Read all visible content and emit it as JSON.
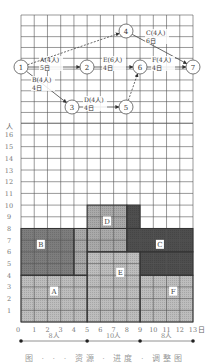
{
  "figure": {
    "caption": "图 · · · 资源 · 进度 · 调整图",
    "colors": {
      "grid": "#555555",
      "light_block": "#bdbdbd",
      "mid_block": "#a9a9a9",
      "dark_block": "#7d7d7d",
      "darker_block": "#4e4e4e",
      "node_stroke": "#555555",
      "arrow": "#444444"
    }
  },
  "network": {
    "nodes": [
      {
        "id": "1",
        "x": 21,
        "y": 67
      },
      {
        "id": "2",
        "x": 87,
        "y": 67
      },
      {
        "id": "3",
        "x": 72,
        "y": 107
      },
      {
        "id": "4",
        "x": 126,
        "y": 31
      },
      {
        "id": "5",
        "x": 126,
        "y": 107
      },
      {
        "id": "6",
        "x": 140,
        "y": 67
      },
      {
        "id": "7",
        "x": 193,
        "y": 67
      }
    ],
    "activities": [
      {
        "from": "1",
        "to": "2",
        "label": "A(4人)",
        "duration": "5日",
        "lx": 40,
        "ly": 62,
        "dashed": false
      },
      {
        "from": "1",
        "to": "3",
        "label": "B(4人)",
        "duration": "4日",
        "lx": 32,
        "ly": 82,
        "dashed": false
      },
      {
        "from": "1",
        "to": "4",
        "label": "",
        "duration": "",
        "lx": 0,
        "ly": 0,
        "dashed": true
      },
      {
        "from": "4",
        "to": "7",
        "label": "C(4人)",
        "duration": "6日",
        "lx": 146,
        "ly": 35,
        "dashed": false
      },
      {
        "from": "3",
        "to": "5",
        "label": "D(4人)",
        "duration": "4日",
        "lx": 84,
        "ly": 102,
        "dashed": false
      },
      {
        "from": "2",
        "to": "6",
        "label": "E(6人)",
        "duration": "4日",
        "lx": 103,
        "ly": 62,
        "dashed": false
      },
      {
        "from": "5",
        "to": "6",
        "label": "",
        "duration": "",
        "lx": 0,
        "ly": 0,
        "dashed": true
      },
      {
        "from": "6",
        "to": "7",
        "label": "F(4人)",
        "duration": "4日",
        "lx": 152,
        "ly": 62,
        "dashed": false
      }
    ]
  },
  "chart_data": {
    "type": "area",
    "title": "",
    "xlabel": "日",
    "ylabel": "人",
    "x_ticks": [
      "0",
      "1",
      "2",
      "3",
      "4",
      "5",
      "6",
      "7",
      "8",
      "9",
      "10",
      "11",
      "12",
      "13"
    ],
    "y_ticks": [
      "1",
      "2",
      "3",
      "4",
      "5",
      "6",
      "7",
      "8",
      "9",
      "10",
      "11",
      "12",
      "13",
      "14",
      "15",
      "16"
    ],
    "xlim": [
      0,
      13
    ],
    "ylim": [
      0,
      16
    ],
    "blocks": [
      {
        "name": "A",
        "shade": "light",
        "rects": [
          [
            0,
            0,
            5,
            4
          ]
        ],
        "label_x": 2.5,
        "label_y": 2.6
      },
      {
        "name": "B",
        "shade": "dark",
        "rects": [
          [
            0,
            4,
            4,
            8
          ]
        ],
        "label_x": 1.5,
        "label_y": 6.6
      },
      {
        "name": "E",
        "shade": "light",
        "rects": [
          [
            5,
            0,
            9,
            6
          ]
        ],
        "label_x": 7.5,
        "label_y": 4.2
      },
      {
        "name": "D",
        "shade": "mid",
        "rects": [
          [
            4,
            4,
            5,
            8
          ],
          [
            5,
            6,
            8,
            8
          ],
          [
            5,
            8,
            8,
            10
          ]
        ],
        "label_x": 6.5,
        "label_y": 8.6
      },
      {
        "name": "C",
        "shade": "darker",
        "rects": [
          [
            8,
            8,
            9,
            10
          ],
          [
            8,
            6,
            13,
            8
          ],
          [
            9,
            4,
            13,
            6
          ]
        ],
        "label_x": 10.5,
        "label_y": 6.6
      },
      {
        "name": "F",
        "shade": "light",
        "rects": [
          [
            9,
            0,
            13,
            4
          ]
        ],
        "label_x": 11.5,
        "label_y": 2.6
      }
    ],
    "resource_profile": [
      {
        "from": 0,
        "to": 5,
        "label": "8人"
      },
      {
        "from": 5,
        "to": 9,
        "label": "10人"
      },
      {
        "from": 9,
        "to": 13,
        "label": "8人"
      }
    ]
  }
}
